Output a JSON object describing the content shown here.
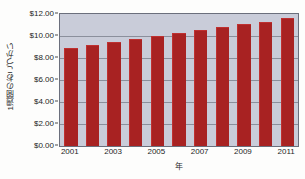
{
  "chart_data": {
    "type": "bar",
    "title": "",
    "xlabel": "年",
    "ylabel": "1週間のおこづかい",
    "categories": [
      2001,
      2002,
      2003,
      2004,
      2005,
      2006,
      2007,
      2008,
      2009,
      2010,
      2011
    ],
    "values": [
      8.95,
      9.2,
      9.45,
      9.7,
      10.0,
      10.25,
      10.55,
      10.8,
      11.05,
      11.3,
      11.6
    ],
    "ylim": [
      0,
      12
    ],
    "ytick_labels": [
      "$0.00",
      "$2.00",
      "$4.00",
      "$6.00",
      "$8.00",
      "$10.00",
      "$12.00"
    ],
    "ytick_values": [
      0,
      2,
      4,
      6,
      8,
      10,
      12
    ],
    "xtick_labels": [
      "2001",
      "2003",
      "2005",
      "2007",
      "2009",
      "2011"
    ],
    "xtick_values": [
      2001,
      2003,
      2005,
      2007,
      2009,
      2011
    ],
    "grid": true,
    "legend": false,
    "bar_color": "#a82222",
    "plot_background": "#c9ccd9",
    "figure_background": "#fdfdfc",
    "axis_color": "#6b6f7c"
  }
}
